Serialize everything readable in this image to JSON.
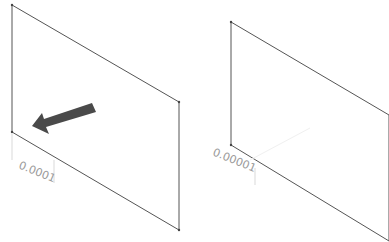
{
  "panels": [
    {
      "name": "left-plane",
      "dimension_label": "0.0001",
      "has_arrow": true
    },
    {
      "name": "right-plane",
      "dimension_label": "0.00001",
      "has_arrow": false
    }
  ],
  "colors": {
    "edge": "#555555",
    "arrow": "#4a4a4a",
    "dimension_text": "#9a9a9a",
    "background": "#ffffff"
  }
}
